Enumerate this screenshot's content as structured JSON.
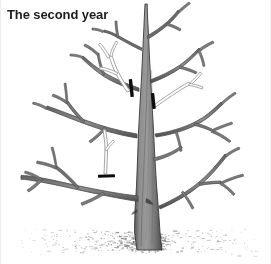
{
  "figure": {
    "title": "The second year",
    "kind": "line-illustration",
    "background_color": "#ffffff",
    "width": 271,
    "height": 264
  },
  "palette": {
    "branch_dark": "#4a4a4a",
    "branch_mid": "#6e6e6e",
    "branch_light": "#8d8d8d",
    "trunk_fill": "#8a8a8a",
    "trunk_outline": "#3f3f3f",
    "remove_shoot_outline": "#9a9a9a",
    "remove_shoot_fill": "#ffffff",
    "cut_mark": "#0d0d0d",
    "ground_stipple": "#6b6b6b",
    "title_color": "#1d1d1d"
  },
  "annotations": {
    "cut_marks": [
      {
        "id": "cut-mark-1",
        "x": 130,
        "y": 88,
        "angle": -6,
        "length": 18,
        "thickness": 3.2
      },
      {
        "id": "cut-mark-2",
        "x": 152,
        "y": 101,
        "angle": -6,
        "length": 16,
        "thickness": 3.2
      },
      {
        "id": "cut-mark-3",
        "x": 105,
        "y": 176,
        "angle": 82,
        "length": 16,
        "thickness": 3.0
      }
    ],
    "removal_shoots": [
      {
        "id": "removal-shoot-upper-left",
        "label": "upright shoot to remove (left of leader)"
      },
      {
        "id": "removal-shoot-upper-right",
        "label": "upright shoot to remove (right of leader)"
      },
      {
        "id": "removal-shoot-lower-left",
        "label": "water sprout to remove (lower left limb)"
      }
    ]
  },
  "tree": {
    "trunk": {
      "id": "trunk",
      "base_x": 143,
      "base_y": 248,
      "top_x": 145,
      "top_y": 4,
      "base_width": 14,
      "top_width": 2
    },
    "scaffold_branches": [
      {
        "id": "branch-left-upper",
        "side": "left",
        "origin_y": 112
      },
      {
        "id": "branch-left-mid",
        "side": "left",
        "origin_y": 130
      },
      {
        "id": "branch-left-lower",
        "side": "left",
        "origin_y": 190
      },
      {
        "id": "branch-right-upper",
        "side": "right",
        "origin_y": 70
      },
      {
        "id": "branch-right-mid",
        "side": "right",
        "origin_y": 122
      },
      {
        "id": "branch-right-lower",
        "side": "right",
        "origin_y": 150
      },
      {
        "id": "branch-right-bottom",
        "side": "right",
        "origin_y": 200
      },
      {
        "id": "branch-top-left",
        "side": "left",
        "origin_y": 46
      },
      {
        "id": "branch-top-right",
        "side": "right",
        "origin_y": 30
      }
    ]
  },
  "ground": {
    "id": "ground-line",
    "center_y": 240,
    "left_x": 20,
    "right_x": 255,
    "stipple_count": 560,
    "label": "soil surface stipple"
  }
}
